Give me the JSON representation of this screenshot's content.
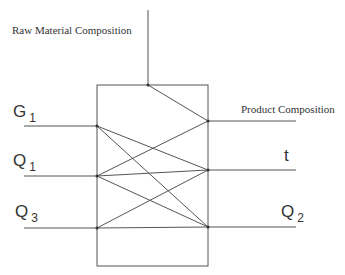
{
  "diagram": {
    "type": "process-block-crossing-diagram",
    "labels": {
      "raw_material": "Raw Material Composition",
      "product": "Product Composition",
      "g1_main": "G",
      "g1_sub": "1",
      "q1_main": "Q",
      "q1_sub": "1",
      "q3_main": "Q",
      "q3_sub": "3",
      "t": "t",
      "q2_main": "Q",
      "q2_sub": "2"
    },
    "inputs": [
      "Raw Material Composition",
      "G1",
      "Q1",
      "Q3"
    ],
    "outputs": [
      "Product Composition",
      "t",
      "Q2"
    ],
    "line_color": "#555555"
  }
}
